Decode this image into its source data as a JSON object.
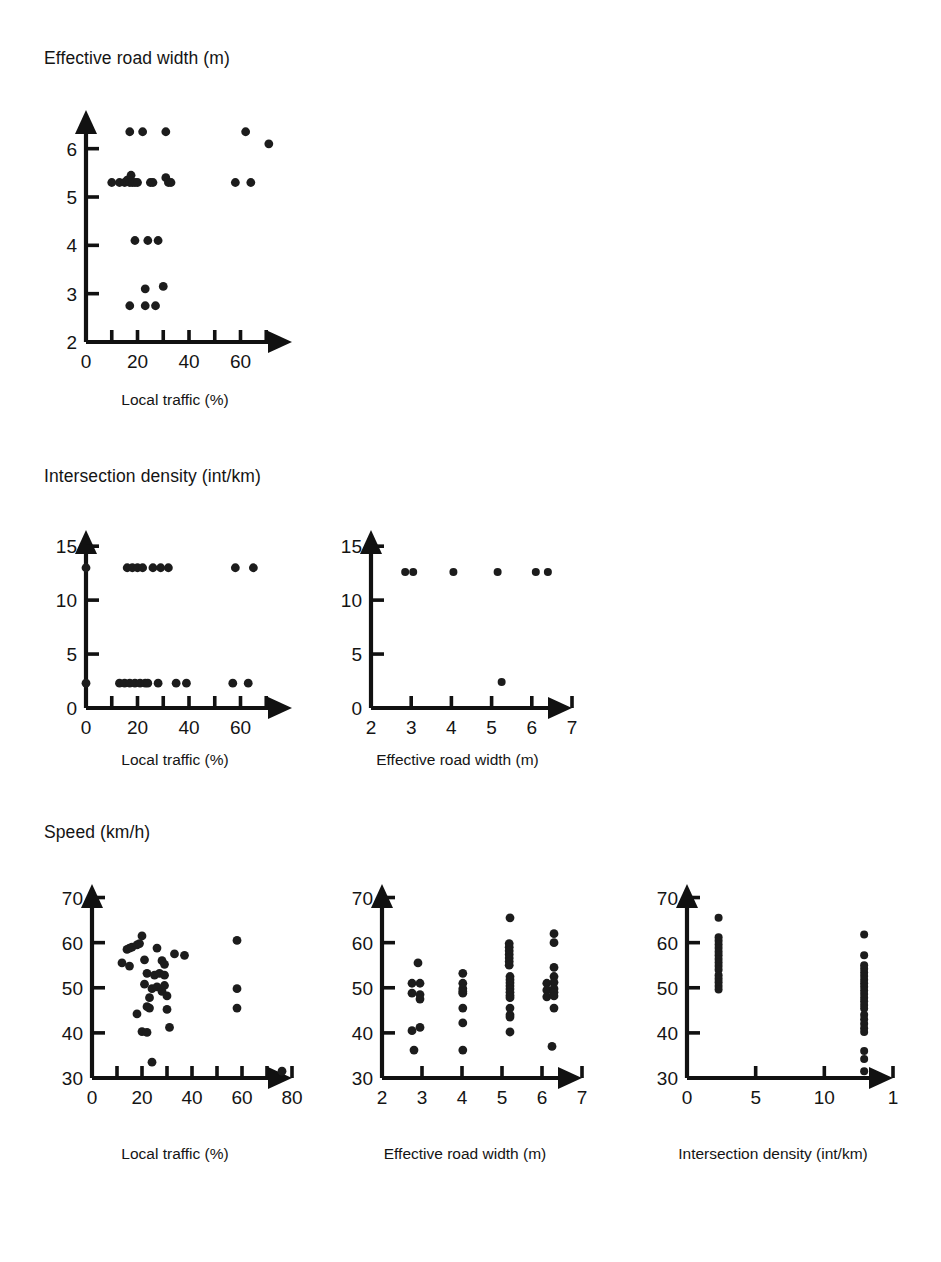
{
  "figure": {
    "rows": [
      {
        "title": "Effective road width (m)"
      },
      {
        "title": "Intersection density (int/km)"
      },
      {
        "title": "Speed (km/h)"
      }
    ]
  },
  "chart_data": [
    {
      "id": "road-width-vs-local-traffic",
      "type": "scatter",
      "title": "Effective road width (m)",
      "xlabel": "Local traffic (%)",
      "ylabel": "Effective road width (m)",
      "xlim": [
        0,
        80
      ],
      "ylim": [
        2,
        6.8
      ],
      "xticks": [
        0,
        10,
        20,
        30,
        40,
        50,
        60,
        70
      ],
      "xticklabels": [
        "0",
        "",
        "20",
        "",
        "40",
        "",
        "60",
        ""
      ],
      "yticks": [
        2,
        3,
        4,
        5,
        6
      ],
      "yticklabels": [
        "2",
        "3",
        "4",
        "5",
        "6"
      ],
      "grid": false,
      "legend": null,
      "points": [
        [
          17,
          6.35
        ],
        [
          22,
          6.35
        ],
        [
          31,
          6.35
        ],
        [
          62,
          6.35
        ],
        [
          71,
          6.1
        ],
        [
          10,
          5.3
        ],
        [
          13,
          5.3
        ],
        [
          15,
          5.3
        ],
        [
          16,
          5.35
        ],
        [
          17,
          5.3
        ],
        [
          17.5,
          5.45
        ],
        [
          18,
          5.3
        ],
        [
          19,
          5.3
        ],
        [
          20,
          5.3
        ],
        [
          25,
          5.3
        ],
        [
          26,
          5.3
        ],
        [
          31,
          5.4
        ],
        [
          32,
          5.3
        ],
        [
          33,
          5.3
        ],
        [
          58,
          5.3
        ],
        [
          64,
          5.3
        ],
        [
          19,
          4.1
        ],
        [
          24,
          4.1
        ],
        [
          28,
          4.1
        ],
        [
          23,
          3.1
        ],
        [
          30,
          3.15
        ],
        [
          17,
          2.75
        ],
        [
          23,
          2.75
        ],
        [
          27,
          2.75
        ]
      ]
    },
    {
      "id": "intersection-density-vs-local-traffic",
      "type": "scatter",
      "title": "Intersection density (int/km)",
      "xlabel": "Local traffic (%)",
      "ylabel": "Intersection density (int/km)",
      "xlim": [
        0,
        80
      ],
      "ylim": [
        0,
        16.5
      ],
      "xticks": [
        0,
        10,
        20,
        30,
        40,
        50,
        60,
        70
      ],
      "xticklabels": [
        "0",
        "",
        "20",
        "",
        "40",
        "",
        "60",
        ""
      ],
      "yticks": [
        0,
        5,
        10,
        15
      ],
      "yticklabels": [
        "0",
        "5",
        "10",
        "15"
      ],
      "grid": false,
      "legend": null,
      "points": [
        [
          0,
          13
        ],
        [
          16,
          13
        ],
        [
          18,
          13
        ],
        [
          20,
          13
        ],
        [
          22,
          13
        ],
        [
          26,
          13
        ],
        [
          29,
          13
        ],
        [
          32,
          13
        ],
        [
          58,
          13
        ],
        [
          65,
          13
        ],
        [
          0,
          2.3
        ],
        [
          13,
          2.3
        ],
        [
          15,
          2.3
        ],
        [
          17,
          2.3
        ],
        [
          19,
          2.3
        ],
        [
          21,
          2.3
        ],
        [
          23,
          2.3
        ],
        [
          24,
          2.3
        ],
        [
          28,
          2.3
        ],
        [
          35,
          2.3
        ],
        [
          39,
          2.3
        ],
        [
          57,
          2.3
        ],
        [
          63,
          2.3
        ]
      ]
    },
    {
      "id": "intersection-density-vs-road-width",
      "type": "scatter",
      "title": "Intersection density (int/km)",
      "xlabel": "Effective road width (m)",
      "ylabel": "Intersection density (int/km)",
      "xlim": [
        2,
        7
      ],
      "ylim": [
        0,
        16.5
      ],
      "xticks": [
        2,
        3,
        4,
        5,
        6,
        7
      ],
      "xticklabels": [
        "2",
        "3",
        "4",
        "5",
        "6",
        "7"
      ],
      "yticks": [
        0,
        5,
        10,
        15
      ],
      "yticklabels": [
        "0",
        "5",
        "10",
        "15"
      ],
      "grid": false,
      "legend": null,
      "points": [
        [
          2.85,
          12.6
        ],
        [
          3.05,
          12.6
        ],
        [
          4.05,
          12.6
        ],
        [
          5.15,
          12.6
        ],
        [
          6.1,
          12.6
        ],
        [
          6.4,
          12.6
        ],
        [
          5.25,
          2.4
        ]
      ]
    },
    {
      "id": "speed-vs-local-traffic",
      "type": "scatter",
      "title": "Speed (km/h)",
      "xlabel": "Local traffic (%)",
      "ylabel": "Speed (km/h)",
      "xlim": [
        0,
        80
      ],
      "ylim": [
        30,
        73
      ],
      "xticks": [
        0,
        10,
        20,
        30,
        40,
        50,
        60,
        70,
        80
      ],
      "xticklabels": [
        "0",
        "",
        "20",
        "",
        "40",
        "",
        "60",
        "",
        "80"
      ],
      "yticks": [
        30,
        40,
        50,
        60,
        70
      ],
      "yticklabels": [
        "30",
        "40",
        "50",
        "60",
        "70"
      ],
      "grid": false,
      "legend": null,
      "points": [
        [
          20,
          61.5
        ],
        [
          58,
          60.5
        ],
        [
          14,
          58.5
        ],
        [
          15,
          58.8
        ],
        [
          16,
          59
        ],
        [
          18,
          59.5
        ],
        [
          19,
          59.8
        ],
        [
          26,
          58.8
        ],
        [
          33,
          57.5
        ],
        [
          37,
          57.2
        ],
        [
          12,
          55.5
        ],
        [
          15,
          54.8
        ],
        [
          21,
          56.2
        ],
        [
          28,
          56
        ],
        [
          29,
          55.2
        ],
        [
          22,
          53.2
        ],
        [
          25,
          52.8
        ],
        [
          27,
          53.2
        ],
        [
          29,
          52.8
        ],
        [
          21,
          50.8
        ],
        [
          24,
          49.8
        ],
        [
          26,
          50.2
        ],
        [
          28,
          49.2
        ],
        [
          29,
          50.5
        ],
        [
          23,
          47.8
        ],
        [
          30,
          48.2
        ],
        [
          58,
          49.8
        ],
        [
          22,
          45.8
        ],
        [
          23,
          45.5
        ],
        [
          30,
          45.2
        ],
        [
          58,
          45.5
        ],
        [
          18,
          44.2
        ],
        [
          20,
          40.3
        ],
        [
          22,
          40.1
        ],
        [
          31,
          41.2
        ],
        [
          24,
          33.5
        ],
        [
          76,
          31.5
        ]
      ]
    },
    {
      "id": "speed-vs-road-width",
      "type": "scatter",
      "title": "Speed (km/h)",
      "xlabel": "Effective road width (m)",
      "ylabel": "Speed (km/h)",
      "xlim": [
        2,
        7
      ],
      "ylim": [
        30,
        73
      ],
      "xticks": [
        2,
        3,
        4,
        5,
        6,
        7
      ],
      "xticklabels": [
        "2",
        "3",
        "4",
        "5",
        "6",
        "7"
      ],
      "yticks": [
        30,
        40,
        50,
        60,
        70
      ],
      "yticklabels": [
        "30",
        "40",
        "50",
        "60",
        "70"
      ],
      "grid": false,
      "legend": null,
      "points": [
        [
          2.9,
          55.5
        ],
        [
          2.75,
          51
        ],
        [
          2.95,
          51
        ],
        [
          2.75,
          48.8
        ],
        [
          2.95,
          48.5
        ],
        [
          2.95,
          47.5
        ],
        [
          2.75,
          40.5
        ],
        [
          2.95,
          41.2
        ],
        [
          2.8,
          36.2
        ],
        [
          4.02,
          53.2
        ],
        [
          4.02,
          51
        ],
        [
          4.02,
          49.8
        ],
        [
          4.02,
          49.2
        ],
        [
          4.02,
          48.8
        ],
        [
          4.02,
          45.5
        ],
        [
          4.02,
          42.2
        ],
        [
          4.02,
          36.2
        ],
        [
          5.2,
          65.5
        ],
        [
          5.18,
          59.8
        ],
        [
          5.18,
          59
        ],
        [
          5.18,
          58.2
        ],
        [
          5.18,
          57.4
        ],
        [
          5.18,
          56.6
        ],
        [
          5.18,
          55.8
        ],
        [
          5.18,
          55
        ],
        [
          5.2,
          52.5
        ],
        [
          5.2,
          51.8
        ],
        [
          5.2,
          51.1
        ],
        [
          5.2,
          50.4
        ],
        [
          5.2,
          49.7
        ],
        [
          5.2,
          49
        ],
        [
          5.2,
          48.3
        ],
        [
          5.2,
          47.8
        ],
        [
          5.2,
          45.5
        ],
        [
          5.2,
          44
        ],
        [
          5.2,
          43.5
        ],
        [
          5.2,
          40.2
        ],
        [
          6.3,
          62
        ],
        [
          6.3,
          60
        ],
        [
          6.3,
          54.5
        ],
        [
          6.3,
          52.5
        ],
        [
          6.12,
          51
        ],
        [
          6.3,
          51.2
        ],
        [
          6.12,
          49.5
        ],
        [
          6.3,
          49.8
        ],
        [
          6.3,
          49
        ],
        [
          6.12,
          48
        ],
        [
          6.3,
          48.2
        ],
        [
          6.3,
          45.5
        ],
        [
          6.25,
          37
        ]
      ]
    },
    {
      "id": "speed-vs-intersection-density",
      "type": "scatter",
      "title": "Speed (km/h)",
      "xlabel": "Intersection density (int/km)",
      "ylabel": "Speed (km/h)",
      "xlim": [
        0,
        15
      ],
      "ylim": [
        30,
        73
      ],
      "xticks": [
        0,
        5,
        10,
        15
      ],
      "xticklabels": [
        "0",
        "5",
        "10",
        "1"
      ],
      "yticks": [
        30,
        40,
        50,
        60,
        70
      ],
      "yticklabels": [
        "30",
        "40",
        "50",
        "60",
        "70"
      ],
      "grid": false,
      "legend": null,
      "points": [
        [
          2.3,
          65.5
        ],
        [
          2.3,
          61.2
        ],
        [
          2.3,
          60.4
        ],
        [
          2.3,
          59.6
        ],
        [
          2.3,
          58.8
        ],
        [
          2.3,
          58
        ],
        [
          2.3,
          57.2
        ],
        [
          2.3,
          56.4
        ],
        [
          2.3,
          55.6
        ],
        [
          2.3,
          54.8
        ],
        [
          2.3,
          54
        ],
        [
          2.3,
          52.8
        ],
        [
          2.3,
          52
        ],
        [
          2.3,
          51.2
        ],
        [
          2.3,
          50.4
        ],
        [
          2.3,
          49.6
        ],
        [
          12.9,
          61.8
        ],
        [
          12.9,
          57.2
        ],
        [
          12.9,
          55
        ],
        [
          12.9,
          54.2
        ],
        [
          12.9,
          53.4
        ],
        [
          12.9,
          52.6
        ],
        [
          12.9,
          51.8
        ],
        [
          12.9,
          51
        ],
        [
          12.9,
          50.2
        ],
        [
          12.9,
          49.4
        ],
        [
          12.9,
          48.6
        ],
        [
          12.9,
          47.8
        ],
        [
          12.9,
          47
        ],
        [
          12.9,
          46.2
        ],
        [
          12.9,
          45.4
        ],
        [
          12.9,
          44
        ],
        [
          12.9,
          43
        ],
        [
          12.9,
          42
        ],
        [
          12.9,
          41
        ],
        [
          12.9,
          40.2
        ],
        [
          12.9,
          36
        ],
        [
          12.9,
          34.2
        ],
        [
          12.9,
          31.5
        ]
      ]
    }
  ]
}
